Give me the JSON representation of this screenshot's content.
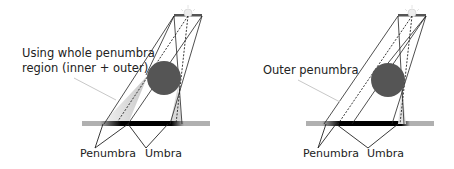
{
  "panels": [
    {
      "id": "whole",
      "annotation": [
        "Using whole penumbra",
        "region (inner + outer)"
      ],
      "labels": {
        "penumbra": "Penumbra",
        "umbra": "Umbra"
      }
    },
    {
      "id": "outer",
      "annotation": [
        "Outer penumbra"
      ],
      "labels": {
        "penumbra": "Penumbra",
        "umbra": "Umbra"
      }
    }
  ],
  "colors": {
    "sphere": "#555555",
    "ground": "#b0b0b0",
    "umbra": "#000000",
    "penumbra_fill": "#d8d8d8",
    "lines": "#222222",
    "arrow": "#c8c8c8",
    "sun": "#e8e8e8"
  },
  "icons": {
    "light_source": "sun-icon"
  }
}
